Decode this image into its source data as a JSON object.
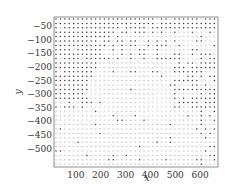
{
  "chart_data": {
    "type": "quiver",
    "title": "",
    "xlabel": "x",
    "ylabel": "y",
    "xlim": [
      12,
      672
    ],
    "ylim": [
      -567,
      -17
    ],
    "xticks": [
      100,
      200,
      300,
      400,
      500,
      600
    ],
    "yticks": [
      -50,
      -100,
      -150,
      -200,
      -250,
      -300,
      -350,
      -400,
      -450,
      -500
    ],
    "xtick_labels": [
      "100",
      "200",
      "300",
      "400",
      "500",
      "600"
    ],
    "ytick_labels": [
      "−50",
      "−100",
      "−150",
      "−200",
      "−250",
      "−300",
      "−350",
      "−400",
      "−450",
      "−500"
    ],
    "grid": false,
    "legend": null,
    "grid_spacing": 16,
    "colors": {
      "dots": "#333333",
      "arrows": "#999999",
      "axis": "#333333"
    }
  }
}
